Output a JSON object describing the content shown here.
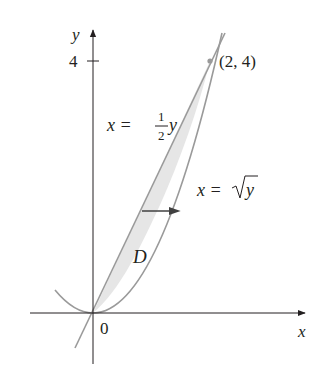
{
  "figure": {
    "type": "region-diagram",
    "axes": {
      "x_label": "x",
      "y_label": "y",
      "origin_label": "0",
      "y_tick_label": "4"
    },
    "region": {
      "label": "D",
      "fill_color": "#e6e6e6"
    },
    "curves": [
      {
        "id": "line",
        "equation_lhs": "x =",
        "frac_num": "1",
        "frac_den": "2",
        "equation_var": "y",
        "color": "#9a9a9a"
      },
      {
        "id": "sqrt",
        "equation_lhs": "x =",
        "sqrt_arg": "y",
        "color": "#9a9a9a"
      }
    ],
    "point": {
      "label": "(2, 4)",
      "x": 2,
      "y": 4
    },
    "arrow": {
      "direction": "right",
      "color": "#404040"
    }
  }
}
